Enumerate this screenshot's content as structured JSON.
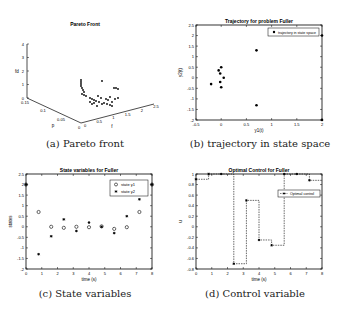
{
  "captions": {
    "a": "(a) Pareto front",
    "b": "(b) trajectory in state space",
    "c": "(c) State variables",
    "d": "(d) Control variable"
  },
  "chart_data": [
    {
      "id": "a",
      "type": "scatter",
      "title": "Pareto Front",
      "is3d": true,
      "xlabel": "p",
      "ylabel": "f",
      "zlabel": "fd",
      "p_ticks": [
        "0.15",
        "0.1",
        "0.05",
        "0"
      ],
      "f_ticks": [
        "0",
        "0.5",
        "1",
        "1.5",
        "2",
        "2.5"
      ],
      "z_ticks": [
        "0",
        "1",
        "2",
        "3",
        "4"
      ],
      "points_2d_approx": [
        [
          81,
          80
        ],
        [
          81,
          82
        ],
        [
          81,
          84
        ],
        [
          81,
          86
        ],
        [
          82,
          88
        ],
        [
          83,
          90
        ],
        [
          84,
          92
        ],
        [
          82,
          94
        ],
        [
          84,
          95
        ],
        [
          86,
          96
        ],
        [
          90,
          98
        ],
        [
          92,
          99
        ],
        [
          94,
          100
        ],
        [
          96,
          101
        ],
        [
          99,
          102
        ],
        [
          102,
          104
        ],
        [
          104,
          103
        ],
        [
          107,
          104
        ],
        [
          110,
          105
        ],
        [
          112,
          106
        ],
        [
          90,
          102
        ],
        [
          92,
          104
        ],
        [
          94,
          103
        ],
        [
          97,
          106
        ],
        [
          108,
          100
        ],
        [
          112,
          102
        ],
        [
          115,
          99
        ],
        [
          118,
          98
        ],
        [
          114,
          88
        ],
        [
          116,
          88
        ],
        [
          118,
          89
        ],
        [
          102,
          81
        ],
        [
          110,
          97
        ],
        [
          106,
          99
        ],
        [
          101,
          98
        ],
        [
          98,
          96
        ]
      ]
    },
    {
      "id": "b",
      "type": "scatter",
      "title": "Trajectory for problem Fuller",
      "xlabel": "y1(t)",
      "ylabel": "y2(t)",
      "xlim": [
        -0.5,
        2
      ],
      "ylim": [
        -2,
        2.5
      ],
      "xticks": [
        "-0.5",
        "0",
        "0.5",
        "1",
        "1.5",
        "2"
      ],
      "yticks": [
        "-2",
        "-1.5",
        "-1",
        "-0.5",
        "0",
        "0.5",
        "1",
        "1.5",
        "2",
        "2.5"
      ],
      "legend": [
        "trajectory in state space"
      ],
      "x": [
        2,
        0.7,
        0.0,
        -0.05,
        -0.02,
        0.05,
        -0.2,
        -0.02,
        0.0,
        0.7,
        2
      ],
      "y": [
        2,
        1.3,
        0.5,
        0.35,
        0.2,
        0.0,
        -0.3,
        -0.2,
        -0.45,
        -1.3,
        -2
      ]
    },
    {
      "id": "c",
      "type": "scatter",
      "title": "State variables for Fuller",
      "xlabel": "time (s)",
      "ylabel": "states",
      "xlim": [
        0,
        8
      ],
      "ylim": [
        -2,
        2.5
      ],
      "xticks": [
        "0",
        "1",
        "2",
        "3",
        "4",
        "5",
        "6",
        "7",
        "8"
      ],
      "yticks": [
        "-2",
        "-1.5",
        "-1",
        "-0.5",
        "0",
        "0.5",
        "1",
        "1.5",
        "2",
        "2.5"
      ],
      "legend": [
        "state y1",
        "state y2"
      ],
      "x": [
        0,
        0.8,
        1.6,
        2.4,
        3.2,
        4.0,
        4.8,
        5.6,
        6.4,
        7.2,
        8.0
      ],
      "series": [
        {
          "name": "state y1",
          "marker": "o",
          "values": [
            2,
            0.7,
            0.0,
            -0.05,
            0.0,
            -0.02,
            0.02,
            -0.1,
            -0.02,
            0.7,
            2
          ]
        },
        {
          "name": "state y2",
          "marker": "*",
          "values": [
            2,
            -1.3,
            -0.45,
            0.35,
            -0.2,
            0.2,
            0.0,
            -0.3,
            0.5,
            1.3,
            2
          ]
        }
      ]
    },
    {
      "id": "d",
      "type": "line",
      "title": "Optimal Control for Fuller",
      "xlabel": "time (s)",
      "ylabel": "u",
      "xlim": [
        0,
        8
      ],
      "ylim": [
        -0.8,
        1
      ],
      "xticks": [
        "0",
        "1",
        "2",
        "3",
        "4",
        "5",
        "6",
        "7",
        "8"
      ],
      "yticks": [
        "-0.8",
        "-0.6",
        "-0.4",
        "-0.2",
        "0",
        "0.2",
        "0.4",
        "0.6",
        "0.8",
        "1"
      ],
      "legend": [
        "Optimal control"
      ],
      "x": [
        0,
        0.8,
        1.6,
        2.4,
        3.2,
        4.0,
        4.8,
        5.6,
        6.4,
        7.2,
        8.0
      ],
      "values": [
        0.9,
        1,
        1,
        -0.7,
        0.5,
        -0.25,
        -0.35,
        1,
        1,
        0.88,
        0.88
      ]
    }
  ]
}
